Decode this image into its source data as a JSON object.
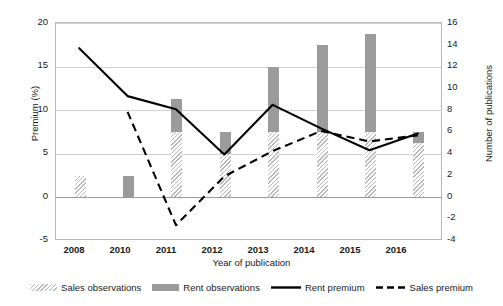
{
  "chart_data": {
    "type": "bar",
    "title": "",
    "xlabel": "Year of publication",
    "ylabel": "Premium (%)",
    "ylabel_secondary": "Number of publications",
    "categories": [
      "2008",
      "2010",
      "2011",
      "2012",
      "2013",
      "2014",
      "2015",
      "2016"
    ],
    "ylim": [
      -5,
      20
    ],
    "yticks": [
      "20",
      "15",
      "10",
      "5",
      "0",
      "-5"
    ],
    "ylim_secondary": [
      -4,
      16
    ],
    "yticks_secondary": [
      "16",
      "14",
      "12",
      "10",
      "8",
      "6",
      "4",
      "2",
      "0",
      "-2",
      "-4"
    ],
    "grid": true,
    "legend_position": "bottom",
    "series": [
      {
        "name": "Sales observations",
        "type": "bar-stacked",
        "axis": "secondary",
        "unit": "publications",
        "values": [
          2,
          0,
          6,
          4,
          6,
          6,
          6,
          5
        ]
      },
      {
        "name": "Rent observations",
        "type": "bar-stacked",
        "axis": "secondary",
        "unit": "publications",
        "values": [
          0,
          2,
          3,
          2,
          6,
          8,
          9,
          1
        ]
      },
      {
        "name": "Rent premium",
        "type": "line",
        "style": "solid",
        "axis": "primary",
        "unit": "%",
        "values": [
          17.0,
          11.5,
          10.0,
          4.8,
          10.5,
          7.8,
          5.3,
          7.2
        ]
      },
      {
        "name": "Sales premium",
        "type": "line",
        "style": "dashed",
        "axis": "primary",
        "unit": "%",
        "values": [
          null,
          9.7,
          -3.3,
          2.3,
          5.2,
          7.5,
          6.3,
          7.0
        ]
      }
    ]
  },
  "legend": {
    "items": [
      {
        "label": "Sales observations",
        "marker": "hatched-swatch"
      },
      {
        "label": "Rent observations",
        "marker": "solid-swatch"
      },
      {
        "label": "Rent premium",
        "marker": "solid-line"
      },
      {
        "label": "Sales premium",
        "marker": "dashed-line"
      }
    ]
  },
  "colors": {
    "bar_rent": "#9b9b9b",
    "bar_sales": "#c6c6c6",
    "line": "#000000",
    "grid": "#d2d2d2",
    "frame": "#b9b9b9"
  }
}
